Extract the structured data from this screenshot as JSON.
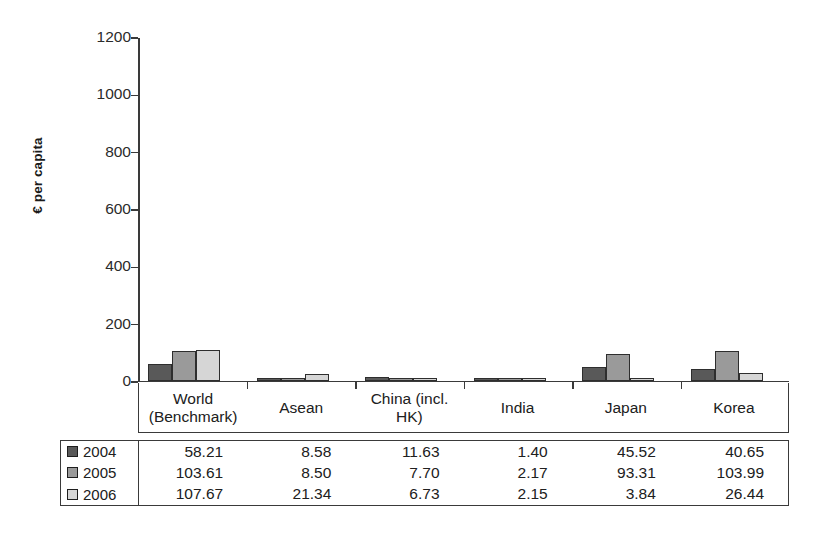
{
  "chart_data": {
    "type": "bar",
    "title": "",
    "subtitle": "",
    "xlabel": "",
    "ylabel": "€ per capita",
    "ylim": [
      0,
      1200
    ],
    "yticks": [
      0,
      200,
      400,
      600,
      800,
      1000,
      1200
    ],
    "ytick_labels": [
      "0",
      "200",
      "400",
      "600",
      "800",
      "1000",
      "1200"
    ],
    "grid": false,
    "legend_position": "table-left",
    "categories": [
      "World (Benchmark)",
      "Asean",
      "China (incl. HK)",
      "India",
      "Japan",
      "Korea"
    ],
    "category_lines": [
      [
        "World",
        "(Benchmark)"
      ],
      [
        "Asean"
      ],
      [
        "China (incl.",
        "HK)"
      ],
      [
        "India"
      ],
      [
        "Japan"
      ],
      [
        "Korea"
      ]
    ],
    "series": [
      {
        "name": "2004",
        "color": "#595959",
        "values": [
          58.21,
          8.58,
          11.63,
          1.4,
          45.52,
          40.65
        ],
        "labels": [
          "58.21",
          "8.58",
          "11.63",
          "1.40",
          "45.52",
          "40.65"
        ]
      },
      {
        "name": "2005",
        "color": "#9a9a9a",
        "values": [
          103.61,
          8.5,
          7.7,
          2.17,
          93.31,
          103.99
        ],
        "labels": [
          "103.61",
          "8.50",
          "7.70",
          "2.17",
          "93.31",
          "103.99"
        ]
      },
      {
        "name": "2006",
        "color": "#d6d6d6",
        "values": [
          107.67,
          21.34,
          6.73,
          2.15,
          3.84,
          26.44
        ],
        "labels": [
          "107.67",
          "21.34",
          "6.73",
          "2.15",
          "3.84",
          "26.44"
        ]
      }
    ]
  },
  "colors": {
    "axis": "#3a3a3a",
    "text": "#202020",
    "background": "#ffffff",
    "bar_border": "#2e2e2e",
    "series_2004": "#595959",
    "series_2005": "#9a9a9a",
    "series_2006": "#d6d6d6"
  }
}
